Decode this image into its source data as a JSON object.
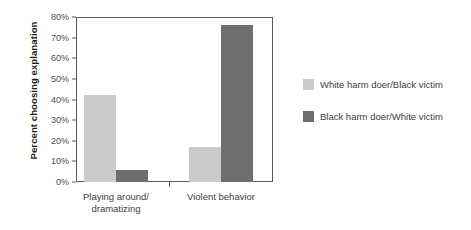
{
  "chart_data": {
    "type": "bar",
    "title": "",
    "xlabel": "",
    "ylabel": "Percent choosing explanation",
    "categories": [
      "Playing around/\ndramatizing",
      "Violent behavior"
    ],
    "category_labels": [
      [
        "Playing around/",
        "dramatizing"
      ],
      [
        "Violent behavior"
      ]
    ],
    "series": [
      {
        "name": "White harm doer/Black victim",
        "color": "#cbcbcb",
        "values": [
          42,
          17
        ]
      },
      {
        "name": "Black harm doer/White victim",
        "color": "#6e6e6e",
        "values": [
          6,
          76
        ]
      }
    ],
    "ylim": [
      0,
      80
    ],
    "y_tick_values": [
      0,
      10,
      20,
      30,
      40,
      50,
      60,
      70,
      80
    ],
    "y_tick_labels": [
      "0%",
      "10%",
      "20%",
      "30%",
      "40%",
      "50%",
      "60%",
      "70%",
      "80%"
    ],
    "y_unit": "%",
    "grid": false,
    "legend_position": "right"
  }
}
